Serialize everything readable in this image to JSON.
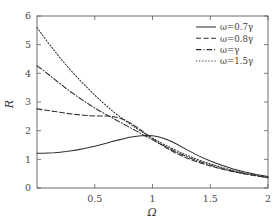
{
  "chart_data": {
    "type": "line",
    "title": "",
    "xlabel": "Ω",
    "ylabel": "R",
    "xlim": [
      0,
      2
    ],
    "ylim": [
      0,
      6
    ],
    "xticks": [
      0.5,
      1,
      1.5,
      2
    ],
    "xtick_labels": [
      "0.5",
      "1",
      "1.5",
      "2"
    ],
    "yticks": [
      0,
      1,
      2,
      3,
      4,
      5,
      6
    ],
    "ytick_labels": [
      "0",
      "1",
      "2",
      "3",
      "4",
      "5",
      "6"
    ],
    "grid": false,
    "legend_position": "top-right",
    "x": [
      0.0,
      0.05,
      0.1,
      0.15,
      0.2,
      0.25,
      0.3,
      0.35,
      0.4,
      0.45,
      0.5,
      0.55,
      0.6,
      0.65,
      0.7,
      0.75,
      0.8,
      0.85,
      0.9,
      0.95,
      1.0,
      1.05,
      1.1,
      1.15,
      1.2,
      1.3,
      1.4,
      1.5,
      1.6,
      1.7,
      1.8,
      1.9,
      2.0
    ],
    "series": [
      {
        "name": "ω=0.7γ",
        "linestyle": "solid",
        "values": [
          1.21,
          1.21,
          1.22,
          1.23,
          1.25,
          1.27,
          1.3,
          1.33,
          1.37,
          1.41,
          1.46,
          1.51,
          1.56,
          1.62,
          1.67,
          1.72,
          1.77,
          1.8,
          1.82,
          1.83,
          1.82,
          1.79,
          1.73,
          1.65,
          1.55,
          1.33,
          1.12,
          0.94,
          0.79,
          0.66,
          0.56,
          0.47,
          0.4
        ]
      },
      {
        "name": "ω=0.8γ",
        "linestyle": "dashed",
        "values": [
          2.76,
          2.73,
          2.7,
          2.67,
          2.64,
          2.61,
          2.58,
          2.56,
          2.54,
          2.52,
          2.51,
          2.51,
          2.51,
          2.5,
          2.46,
          2.39,
          2.29,
          2.16,
          2.02,
          1.87,
          1.72,
          1.58,
          1.45,
          1.33,
          1.22,
          1.04,
          0.89,
          0.77,
          0.66,
          0.57,
          0.49,
          0.42,
          0.36
        ]
      },
      {
        "name": "ω=γ",
        "linestyle": "dashdot",
        "values": [
          4.26,
          4.12,
          3.96,
          3.8,
          3.64,
          3.48,
          3.33,
          3.19,
          3.05,
          2.92,
          2.79,
          2.67,
          2.56,
          2.45,
          2.34,
          2.23,
          2.12,
          2.01,
          1.9,
          1.79,
          1.68,
          1.57,
          1.47,
          1.37,
          1.27,
          1.09,
          0.93,
          0.8,
          0.68,
          0.58,
          0.5,
          0.43,
          0.36
        ]
      },
      {
        "name": "ω=1.5γ",
        "linestyle": "dotted",
        "values": [
          5.6,
          5.32,
          5.05,
          4.79,
          4.54,
          4.3,
          4.07,
          3.85,
          3.64,
          3.44,
          3.24,
          3.05,
          2.87,
          2.7,
          2.54,
          2.39,
          2.25,
          2.11,
          1.98,
          1.86,
          1.74,
          1.63,
          1.52,
          1.42,
          1.32,
          1.14,
          0.98,
          0.84,
          0.72,
          0.61,
          0.52,
          0.44,
          0.37
        ]
      }
    ]
  },
  "legend": {
    "entries": [
      {
        "label": "ω=0.7γ"
      },
      {
        "label": "ω=0.8γ"
      },
      {
        "label": "ω=γ"
      },
      {
        "label": "ω=1.5γ"
      }
    ]
  }
}
